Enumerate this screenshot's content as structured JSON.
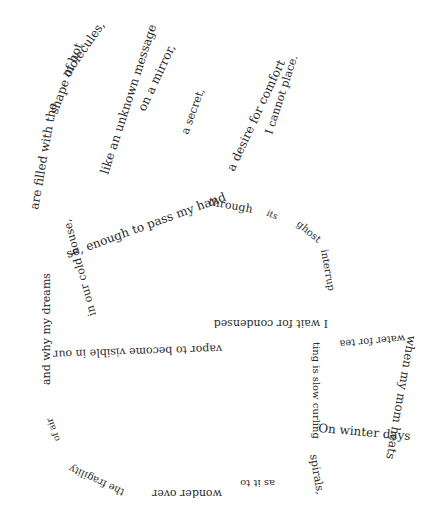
{
  "poem": {
    "background": "#ffffff",
    "ink": "#2a2a2a",
    "phrases": [
      {
        "id": "are-filled",
        "text": "are filled with the",
        "x": 38,
        "y": 210,
        "rotate": -80,
        "size": 12
      },
      {
        "id": "shape-of-hot",
        "text": "shape of hot",
        "x": 57,
        "y": 115,
        "rotate": -70,
        "size": 12
      },
      {
        "id": "molecules",
        "text": "molecules,",
        "x": 68,
        "y": 78,
        "rotate": -55,
        "size": 12
      },
      {
        "id": "like-an",
        "text": "like an unknown message",
        "x": 108,
        "y": 175,
        "rotate": -72,
        "size": 12
      },
      {
        "id": "on-a-mirror",
        "text": "on a mirror,",
        "x": 145,
        "y": 112,
        "rotate": -65,
        "size": 12
      },
      {
        "id": "a-secret",
        "text": "a secret,",
        "x": 188,
        "y": 135,
        "rotate": -70,
        "size": 11
      },
      {
        "id": "a-desire",
        "text": "a desire for comfort",
        "x": 234,
        "y": 172,
        "rotate": -65,
        "size": 12
      },
      {
        "id": "i-cannot-place",
        "text": "I cannot place.",
        "x": 272,
        "y": 135,
        "rotate": -72,
        "size": 11
      },
      {
        "id": "enough-to-pass",
        "text": "se, enough to pass my hand",
        "x": 68,
        "y": 258,
        "rotate": -20,
        "size": 12
      },
      {
        "id": "through",
        "text": "through",
        "x": 208,
        "y": 205,
        "rotate": 10,
        "size": 11
      },
      {
        "id": "its",
        "text": "its",
        "x": 266,
        "y": 215,
        "rotate": 25,
        "size": 9
      },
      {
        "id": "ghost",
        "text": "ghost",
        "x": 296,
        "y": 225,
        "rotate": 40,
        "size": 10
      },
      {
        "id": "interrup",
        "text": "interrup",
        "x": 321,
        "y": 250,
        "rotate": 80,
        "size": 10
      },
      {
        "id": "cold-house",
        "text": "in our cold house,",
        "x": 96,
        "y": 315,
        "rotate": -105,
        "size": 11
      },
      {
        "id": "visible",
        "text": "vapor to become visible in our",
        "x": 222,
        "y": 345,
        "rotate": 178,
        "size": 11
      },
      {
        "id": "i-wait",
        "text": "I wait for condensed",
        "x": 328,
        "y": 320,
        "rotate": 180,
        "size": 11
      },
      {
        "id": "water-for-tea",
        "text": "water for tea",
        "x": 405,
        "y": 335,
        "rotate": 175,
        "size": 10
      },
      {
        "id": "heats",
        "text": "when my mom heats",
        "x": 408,
        "y": 335,
        "rotate": 100,
        "size": 12
      },
      {
        "id": "on-winter-days",
        "text": "On winter days",
        "x": 318,
        "y": 432,
        "rotate": 5,
        "size": 12
      },
      {
        "id": "ting-is-slow",
        "text": "ting is slow curling",
        "x": 313,
        "y": 342,
        "rotate": 90,
        "size": 10
      },
      {
        "id": "spirals",
        "text": "spirals,",
        "x": 310,
        "y": 455,
        "rotate": 80,
        "size": 11
      },
      {
        "id": "as-it-to",
        "text": "as it to",
        "x": 275,
        "y": 480,
        "rotate": 180,
        "size": 10
      },
      {
        "id": "wonder-over",
        "text": "wonder over",
        "x": 222,
        "y": 490,
        "rotate": 180,
        "size": 11
      },
      {
        "id": "the-fragility",
        "text": "the fragility",
        "x": 125,
        "y": 490,
        "rotate": 205,
        "size": 10
      },
      {
        "id": "of-air",
        "text": "of air",
        "x": 60,
        "y": 440,
        "rotate": -110,
        "size": 9
      },
      {
        "id": "and-why-my-dreams",
        "text": "and why my dreams",
        "x": 50,
        "y": 385,
        "rotate": -90,
        "size": 11
      }
    ]
  }
}
